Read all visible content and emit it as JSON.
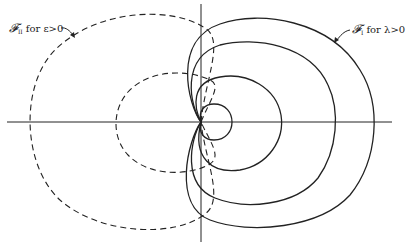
{
  "labels": {
    "family_ii": {
      "symbol": "𝓕",
      "subscript": "II",
      "text": "for ε>0"
    },
    "family_i": {
      "symbol": "𝓕",
      "subscript": "I",
      "text": "for λ>0"
    }
  },
  "colors": {
    "ink": "#222222",
    "background": "#ffffff"
  },
  "figure": {
    "origin": [
      201,
      122
    ],
    "dashed_curves": 2,
    "solid_curves": 4
  }
}
